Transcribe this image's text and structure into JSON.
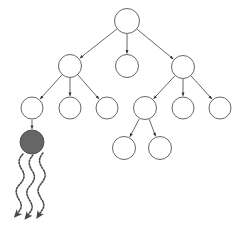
{
  "figure": {
    "kind": "tree-diagram",
    "title": "",
    "background_color": "#ffffff",
    "width": 245,
    "height": 233
  },
  "style": {
    "edge_color": "#555555",
    "edge_width": 0.9,
    "node_stroke_color": "#555555",
    "node_stroke_width": 0.9,
    "node_open_fill": "#ffffff",
    "node_filled_fill": "#666666",
    "node_filled_stroke": "#4a4a4a",
    "arrowhead_color": "#333333",
    "squiggle_color": "#4a4a4a",
    "squiggle_width": 1.6,
    "squiggle_dash": "1.5 1.6"
  },
  "chart_data": {
    "type": "diagram",
    "subtype": "node-link-tree",
    "title": "",
    "nodes": [
      {
        "id": "n0",
        "label": "",
        "cx": 127,
        "cy": 21,
        "r": 12.5,
        "state": "open",
        "depth": 0
      },
      {
        "id": "n1",
        "label": "",
        "cx": 70,
        "cy": 66,
        "r": 11.5,
        "state": "open",
        "depth": 1
      },
      {
        "id": "n2",
        "label": "",
        "cx": 127,
        "cy": 66,
        "r": 11.5,
        "state": "open",
        "depth": 1
      },
      {
        "id": "n3",
        "label": "",
        "cx": 183,
        "cy": 67,
        "r": 11.5,
        "state": "open",
        "depth": 1
      },
      {
        "id": "n4",
        "label": "",
        "cx": 32,
        "cy": 108,
        "r": 11.0,
        "state": "open",
        "depth": 2
      },
      {
        "id": "n5",
        "label": "",
        "cx": 70,
        "cy": 108,
        "r": 11.0,
        "state": "open",
        "depth": 2
      },
      {
        "id": "n6",
        "label": "",
        "cx": 107,
        "cy": 108,
        "r": 11.0,
        "state": "open",
        "depth": 2
      },
      {
        "id": "n7",
        "label": "",
        "cx": 145,
        "cy": 108,
        "r": 11.5,
        "state": "open",
        "depth": 2
      },
      {
        "id": "n8",
        "label": "",
        "cx": 183,
        "cy": 108,
        "r": 11.0,
        "state": "open",
        "depth": 2
      },
      {
        "id": "n9",
        "label": "",
        "cx": 220,
        "cy": 108,
        "r": 11.0,
        "state": "open",
        "depth": 2
      },
      {
        "id": "n10",
        "label": "",
        "cx": 32,
        "cy": 142,
        "r": 12.0,
        "state": "filled",
        "depth": 3
      },
      {
        "id": "n11",
        "label": "",
        "cx": 124,
        "cy": 148,
        "r": 11.5,
        "state": "open",
        "depth": 3
      },
      {
        "id": "n12",
        "label": "",
        "cx": 160,
        "cy": 148,
        "r": 11.5,
        "state": "open",
        "depth": 3
      }
    ],
    "edges": [
      {
        "from": "n0",
        "to": "n1",
        "arrow": true
      },
      {
        "from": "n0",
        "to": "n2",
        "arrow": true
      },
      {
        "from": "n0",
        "to": "n3",
        "arrow": true
      },
      {
        "from": "n1",
        "to": "n4",
        "arrow": true
      },
      {
        "from": "n1",
        "to": "n5",
        "arrow": true
      },
      {
        "from": "n1",
        "to": "n6",
        "arrow": true
      },
      {
        "from": "n3",
        "to": "n7",
        "arrow": true
      },
      {
        "from": "n3",
        "to": "n8",
        "arrow": true
      },
      {
        "from": "n3",
        "to": "n9",
        "arrow": true
      },
      {
        "from": "n4",
        "to": "n10",
        "arrow": true
      },
      {
        "from": "n7",
        "to": "n11",
        "arrow": true
      },
      {
        "from": "n7",
        "to": "n12",
        "arrow": true
      }
    ],
    "squiggle_arrows": [
      {
        "id": "s1",
        "from_node": "n10",
        "start_x": 23,
        "start_y": 154,
        "end_x": 17,
        "end_y": 216,
        "amplitude": 3.2,
        "wavelength": 15
      },
      {
        "id": "s2",
        "from_node": "n10",
        "start_x": 33,
        "start_y": 155,
        "end_x": 28,
        "end_y": 218,
        "amplitude": 3.2,
        "wavelength": 15
      },
      {
        "id": "s3",
        "from_node": "n10",
        "start_x": 43,
        "start_y": 153,
        "end_x": 40,
        "end_y": 217,
        "amplitude": 3.2,
        "wavelength": 15
      }
    ],
    "counts": {
      "total_nodes": 13,
      "open_nodes": 12,
      "filled_nodes": 1,
      "edges": 12,
      "squiggle_arrows": 3,
      "max_depth": 3
    },
    "legend": [],
    "annotations": []
  }
}
